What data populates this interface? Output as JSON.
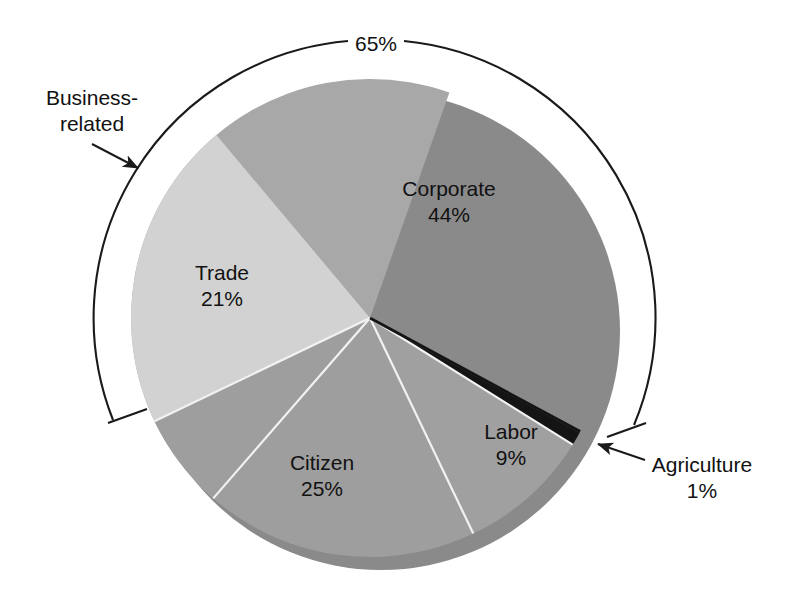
{
  "figure": {
    "background": "#ffffff",
    "type": "pie-chart-3d",
    "text_color": "#111111"
  },
  "chart_data": {
    "type": "pie",
    "title": "",
    "subtitle": "",
    "xlabel": "",
    "ylabel": "",
    "grid": false,
    "legend_position": "none",
    "labels_inside_slices": true,
    "categories": [
      "Corporate",
      "Trade",
      "Citizen",
      "Labor",
      "Agriculture"
    ],
    "values": [
      44,
      21,
      25,
      9,
      1
    ],
    "unit": "%",
    "slices": [
      {
        "name": "Corporate",
        "label": "Corporate",
        "value": 44,
        "value_label": "44%",
        "color": "#a8a8a8",
        "start_angle_deg": 131.0,
        "end_angle_deg": 289.4,
        "label_x": 449,
        "label_y": 190
      },
      {
        "name": "Trade",
        "label": "Trade",
        "value": 21,
        "value_label": "21%",
        "color": "#d2d2d2",
        "start_angle_deg": 154.4,
        "end_angle_deg": 230.0,
        "label_x": 222,
        "label_y": 274
      },
      {
        "name": "Citizen",
        "label": "Citizen",
        "value": 25,
        "value_label": "25%",
        "color": "#9e9e9e",
        "start_angle_deg": 64.4,
        "end_angle_deg": 154.4,
        "label_x": 322,
        "label_y": 464
      },
      {
        "name": "Labor",
        "label": "Labor",
        "value": 9,
        "value_label": "9%",
        "color": "#a0a0a0",
        "start_angle_deg": 32.0,
        "end_angle_deg": 64.4,
        "label_x": 511,
        "label_y": 433
      },
      {
        "name": "Agriculture",
        "label": "Agriculture",
        "value": 1,
        "value_label": "1%",
        "color": "#141414",
        "start_angle_deg": 28.4,
        "end_angle_deg": 32.0,
        "label_x": 702,
        "label_y": 471
      }
    ],
    "annotations": [
      {
        "name": "business-related-group",
        "label": "Business-",
        "label_line2": "related",
        "value_label": "65%",
        "value": 65,
        "covers": [
          "Corporate",
          "Trade"
        ],
        "type": "bracket-with-arrow"
      },
      {
        "name": "agriculture-callout",
        "label": "Agriculture",
        "value_label": "1%",
        "type": "arrow-callout"
      }
    ]
  },
  "labels": {
    "corporate_name": "Corporate",
    "corporate_value": "44%",
    "trade_name": "Trade",
    "trade_value": "21%",
    "citizen_name": "Citizen",
    "citizen_value": "25%",
    "labor_name": "Labor",
    "labor_value": "9%",
    "agriculture_name": "Agriculture",
    "agriculture_value": "1%",
    "business_related_line1": "Business-",
    "business_related_line2": "related",
    "bracket_value": "65%"
  },
  "colors": {
    "corporate": "#a8a8a8",
    "trade": "#d2d2d2",
    "citizen": "#9e9e9e",
    "labor": "#a0a0a0",
    "agriculture": "#141414",
    "rim_shadow": "#8a8a8a",
    "outline": "#1a1a1a",
    "separator": "#f2f2f2",
    "background": "#ffffff"
  }
}
